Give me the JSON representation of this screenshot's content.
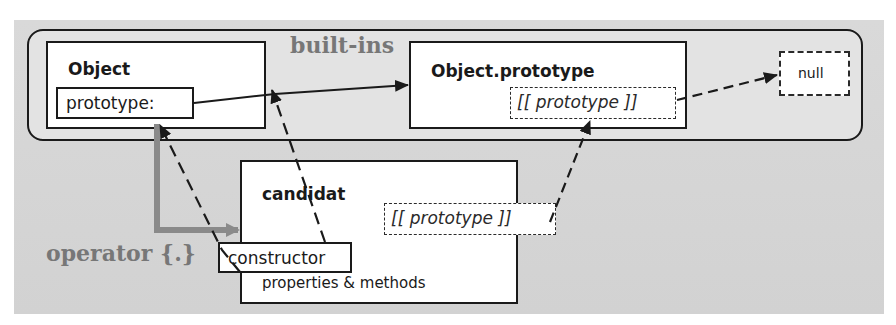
{
  "diagram": {
    "group_label": "built-ins",
    "operator_label": "operator {.}",
    "nodes": {
      "object": {
        "title": "Object",
        "field": "prototype:"
      },
      "object_prototype": {
        "title": "Object.prototype",
        "field": "[[ prototype ]]"
      },
      "null": {
        "label": "null"
      },
      "candidat": {
        "title": "candidat",
        "field": "[[ prototype ]]",
        "constructor": "constructor",
        "members": "properties & methods"
      }
    },
    "edges": [
      {
        "from": "Object.prototype:",
        "to": "Object.prototype",
        "style": "solid"
      },
      {
        "from": "Object.prototype [[prototype]]",
        "to": "null",
        "style": "dashed"
      },
      {
        "from": "candidat [[prototype]]",
        "to": "Object.prototype [[prototype]]",
        "style": "dashed"
      },
      {
        "from": "candidat.constructor",
        "to": "Object.prototype: (link)",
        "style": "dashed"
      },
      {
        "from": "candidat.constructor",
        "to": "Object.prototype:",
        "style": "dashed"
      },
      {
        "from": "Object.prototype:",
        "to": "candidat",
        "style": "thick-gray",
        "label": "operator {.}"
      }
    ],
    "colors": {
      "background": "#d6d6d6",
      "box": "#ffffff",
      "stroke": "#1a1a1a",
      "gray_arrow": "#8a8a8a",
      "gray_text": "#777777"
    }
  }
}
